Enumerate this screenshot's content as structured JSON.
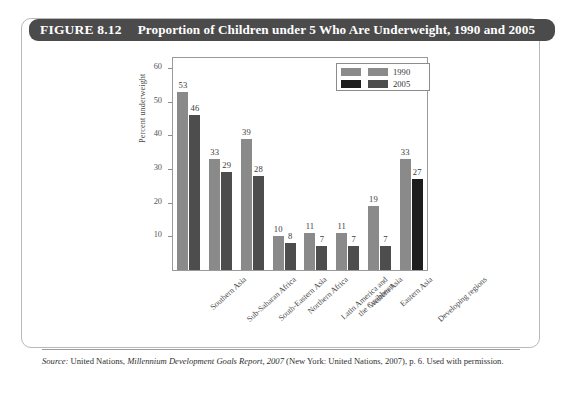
{
  "figure": {
    "number_label": "FIGURE 8.12",
    "title": "Proportion of Children under 5 Who Are Underweight, 1990 and 2005"
  },
  "source_note": {
    "prefix": "Source:",
    "text_part1": " United Nations, ",
    "italic_title": "Millennium Development Goals Report, 2007",
    "text_part2": " (New York: United Nations, 2007), p. 6. Used with permission."
  },
  "colors": {
    "title_bar": "#4b4b4b",
    "series_1990": "#8a8a8a",
    "series_2005": "#4d4d4d",
    "series_2005_last": "#1d1d1d",
    "frame": "#9a9a9a"
  },
  "chart_data": {
    "type": "bar",
    "title": "Proportion of Children under 5 Who Are Underweight, 1990 and 2005",
    "xlabel": "",
    "ylabel": "Percent underweight",
    "ylim": [
      0,
      63
    ],
    "yticks": [
      10,
      20,
      30,
      40,
      50,
      60
    ],
    "grid": false,
    "legend_position": "top-right",
    "categories": [
      "Southern Asia",
      "Sub-Saharan Africa",
      "South-Eastern Asia",
      "Northern Africa",
      "Latin America and\nthe Caribbean",
      "Western Asia",
      "Eastern Asia",
      "Developing regions"
    ],
    "series": [
      {
        "name": "1990",
        "values": [
          53,
          33,
          39,
          10,
          11,
          11,
          19,
          33
        ]
      },
      {
        "name": "2005",
        "values": [
          46,
          29,
          28,
          8,
          7,
          7,
          7,
          27
        ]
      }
    ]
  }
}
